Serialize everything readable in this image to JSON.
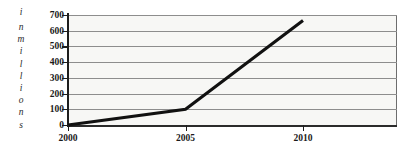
{
  "chart_data": {
    "type": "line",
    "title": "",
    "subtitle": "",
    "xlabel": "",
    "ylabel": "in millions",
    "ylabel_letters": [
      "i",
      "n",
      "m",
      "i",
      "l",
      "l",
      "i",
      "o",
      "n",
      "s"
    ],
    "x": [
      2000,
      2005,
      2010
    ],
    "x_tick_labels": [
      "2000",
      "2005",
      "2010"
    ],
    "series": [
      {
        "name": "",
        "values": [
          0,
          100,
          665
        ]
      }
    ],
    "y_ticks": [
      0,
      100,
      200,
      300,
      400,
      500,
      600,
      700
    ],
    "y_tick_labels": [
      "0",
      "100",
      "200",
      "300",
      "400",
      "500",
      "600",
      "700"
    ],
    "ylim": [
      0,
      700
    ],
    "xlim": [
      2000,
      2014
    ],
    "grid": true,
    "grid_axis": "y",
    "legend": false,
    "legend_position": "none",
    "annotations": [],
    "colors": {
      "line": "#111111",
      "gridline": "#8d8d8d",
      "axis": "#1d1d1d",
      "plot_background": "#f7f7f5",
      "figure_background": "#ffffff",
      "tick_label": "#1a1a1a"
    }
  }
}
